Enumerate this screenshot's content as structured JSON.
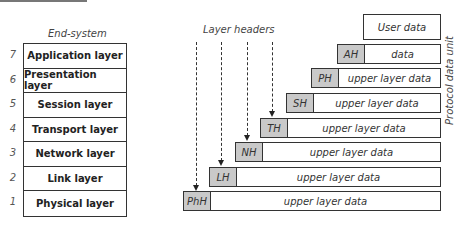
{
  "diagram": {
    "end_system_label": "End-system",
    "layer_headers_label": "Layer headers",
    "pdu_label": "Protocol data unit",
    "user_data": "User data",
    "layers": [
      {
        "num": "7",
        "name": "Application layer",
        "header": "AH",
        "data": "data"
      },
      {
        "num": "6",
        "name": "Presentation layer",
        "header": "PH",
        "data": "upper layer data"
      },
      {
        "num": "5",
        "name": "Session layer",
        "header": "SH",
        "data": "upper layer data"
      },
      {
        "num": "4",
        "name": "Transport layer",
        "header": "TH",
        "data": "upper layer data"
      },
      {
        "num": "3",
        "name": "Network layer",
        "header": "NH",
        "data": "upper layer data"
      },
      {
        "num": "2",
        "name": "Link layer",
        "header": "LH",
        "data": "upper layer data"
      },
      {
        "num": "1",
        "name": "Physical layer",
        "header": "PhH",
        "data": "upper layer data"
      }
    ],
    "colors": {
      "header_fill": "#c9c9c9",
      "border": "#333333"
    }
  }
}
